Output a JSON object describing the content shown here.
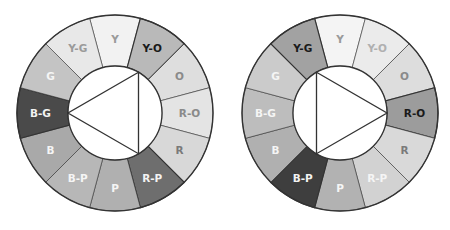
{
  "diagram": {
    "type": "color-wheel-comparison",
    "segment_order": [
      "Y",
      "Y-O",
      "O",
      "R-O",
      "R",
      "R-P",
      "P",
      "B-P",
      "B",
      "B-G",
      "G",
      "Y-G"
    ],
    "wheels": [
      {
        "id": "left",
        "center": [
          115,
          113
        ],
        "outer_radius": 98,
        "inner_radius": 47,
        "highlighted": [
          "Y-O",
          "B-G",
          "R-P"
        ],
        "triangle_vertex_angles": [
          -60,
          180,
          60
        ],
        "segments": [
          {
            "label": "Y",
            "fill": "#f2f2f2",
            "text": "#9a9a9a"
          },
          {
            "label": "Y-O",
            "fill": "#b9b9b9",
            "text": "#1a1a1a"
          },
          {
            "label": "O",
            "fill": "#dedede",
            "text": "#8a8a8a"
          },
          {
            "label": "R-O",
            "fill": "#e4e4e4",
            "text": "#8a8a8a"
          },
          {
            "label": "R",
            "fill": "#d8d8d8",
            "text": "#7a7a7a"
          },
          {
            "label": "R-P",
            "fill": "#6e6e6e",
            "text": "#f2f2f2"
          },
          {
            "label": "P",
            "fill": "#b0b0b0",
            "text": "#f5f5f5"
          },
          {
            "label": "B-P",
            "fill": "#b7b7b7",
            "text": "#f5f5f5"
          },
          {
            "label": "B",
            "fill": "#a9a9a9",
            "text": "#f5f5f5"
          },
          {
            "label": "B-G",
            "fill": "#4a4a4a",
            "text": "#f2f2f2"
          },
          {
            "label": "G",
            "fill": "#c4c4c4",
            "text": "#f5f5f5"
          },
          {
            "label": "Y-G",
            "fill": "#e8e8e8",
            "text": "#9a9a9a"
          }
        ]
      },
      {
        "id": "right",
        "center": [
          340,
          113
        ],
        "outer_radius": 98,
        "inner_radius": 47,
        "highlighted": [
          "Y-G",
          "R-O",
          "B-P"
        ],
        "triangle_vertex_angles": [
          -120,
          0,
          120
        ],
        "segments": [
          {
            "label": "Y",
            "fill": "#f4f4f4",
            "text": "#9a9a9a"
          },
          {
            "label": "Y-O",
            "fill": "#ebebeb",
            "text": "#b0b0b0"
          },
          {
            "label": "O",
            "fill": "#dddddd",
            "text": "#8a8a8a"
          },
          {
            "label": "R-O",
            "fill": "#9c9c9c",
            "text": "#1a1a1a"
          },
          {
            "label": "R",
            "fill": "#d9d9d9",
            "text": "#7a7a7a"
          },
          {
            "label": "R-P",
            "fill": "#d2d2d2",
            "text": "#f5f5f5"
          },
          {
            "label": "P",
            "fill": "#b2b2b2",
            "text": "#f5f5f5"
          },
          {
            "label": "B-P",
            "fill": "#3e3e3e",
            "text": "#f2f2f2"
          },
          {
            "label": "B",
            "fill": "#b0b0b0",
            "text": "#f5f5f5"
          },
          {
            "label": "B-G",
            "fill": "#bdbdbd",
            "text": "#f5f5f5"
          },
          {
            "label": "G",
            "fill": "#cbcbcb",
            "text": "#f5f5f5"
          },
          {
            "label": "Y-G",
            "fill": "#a2a2a2",
            "text": "#1a1a1a"
          }
        ]
      }
    ],
    "stroke_color": "#333333",
    "inner_fill": "#ffffff"
  }
}
